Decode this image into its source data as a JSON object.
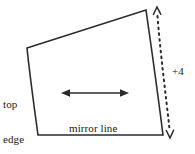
{
  "diagram": {
    "canvas": {
      "width": 195,
      "height": 154
    },
    "colors": {
      "background": "#ffffff",
      "stroke": "#2b2b2b",
      "text": "#1a1a1a",
      "dotted_stroke": "#2b2b2b"
    },
    "labels": {
      "top_edge_line1": "top",
      "top_edge_line2": "edge",
      "mirror_line": "mirror line",
      "offset": "+4"
    },
    "shape": {
      "name": "quadrilateral",
      "vertices": [
        {
          "x": 27,
          "y": 48
        },
        {
          "x": 146,
          "y": 10
        },
        {
          "x": 163,
          "y": 135
        },
        {
          "x": 38,
          "y": 135
        }
      ],
      "path": "M 27 48 L 146 10 C 152 52 158 95 163 135 L 38 135 C 34 106 30 77 27 48 Z"
    },
    "arrows": {
      "horizontal": {
        "name": "width-arrow",
        "x1": 62,
        "y1": 93,
        "x2": 128,
        "y2": 93,
        "double_headed": true,
        "style": "solid"
      },
      "vertical_dotted": {
        "name": "offset-arrow",
        "x1": 157,
        "y1": 9,
        "x2": 170,
        "y2": 135,
        "double_headed": true,
        "style": "dotted",
        "dash": "1.6 4.2"
      }
    }
  }
}
